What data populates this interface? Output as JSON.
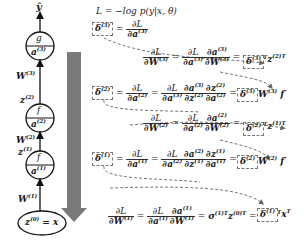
{
  "loss": {
    "label": "L = −log p(y|x, θ)"
  },
  "network": {
    "output": "ŷ",
    "nodes": [
      {
        "top": "g",
        "bottom": "a",
        "bottom_sup": "(3)"
      },
      {
        "top": "f",
        "bottom": "a",
        "bottom_sup": "(2)"
      },
      {
        "top": "f",
        "bottom": "a",
        "bottom_sup": "(1)"
      }
    ],
    "input": {
      "base": "z",
      "sup": "(0)",
      "rest": " = x"
    },
    "edge_labels": [
      {
        "base": "W",
        "sup": "(3)"
      },
      {
        "base": "z",
        "sup": "(2)"
      },
      {
        "base": "W",
        "sup": "(2)"
      },
      {
        "base": "z",
        "sup": "(1)"
      },
      {
        "base": "W",
        "sup": "(1)"
      }
    ]
  },
  "backprop_arrow": {
    "color": "#7a7a7a",
    "direction": "down"
  },
  "equations": {
    "delta3": {
      "delta": "δ",
      "sup": "(3)",
      "rhs_num": "∂L",
      "rhs_den": "∂a",
      "rhs_den_sup": "(3)"
    },
    "dW3": {
      "lhs_num": "∂L",
      "lhs_den": "∂W",
      "lhs_den_sup": "(3)",
      "mid1_num": "∂L",
      "mid1_den": "∂a",
      "mid1_den_sup": "(3)",
      "mid2_num": "∂a",
      "mid2_num_sup": "(3)",
      "mid2_den": "∂W",
      "mid2_den_sup": "(3)",
      "result_delta": "δ",
      "result_sup": "(3)",
      "result_tail": "ᵀz",
      "result_tail_sup": "(2)T"
    },
    "delta2": {
      "delta": "δ",
      "sup": "(2)",
      "rhs_num": "∂L",
      "rhs_den": "∂a",
      "rhs_den_sup": "(2)",
      "c1_num": "∂L",
      "c1_den": "∂a",
      "c1_den_sup": "(3)",
      "c2_num": "∂a",
      "c2_num_sup": "(3)",
      "c2_den": "∂z",
      "c2_den_sup": "(2)",
      "c3_num": "∂z",
      "c3_num_sup": "(2)",
      "c3_den": "∂a",
      "c3_den_sup": "(2)",
      "result_delta": "δ",
      "result_sup": "(3)",
      "result_tail": "W",
      "result_tail_sup": "(3)",
      "result_end": "f′"
    },
    "dW2": {
      "lhs_num": "∂L",
      "lhs_den": "∂W",
      "lhs_den_sup": "(2)",
      "mid1_num": "∂L",
      "mid1_den": "∂a",
      "mid1_den_sup": "(2)",
      "mid2_num": "∂a",
      "mid2_num_sup": "(2)",
      "mid2_den": "∂W",
      "mid2_den_sup": "(2)",
      "result_delta": "δ",
      "result_sup": "(2)",
      "result_tail": "ᵀz",
      "result_tail_sup": "(1)T"
    },
    "delta1": {
      "delta": "δ",
      "sup": "(1)",
      "rhs_num": "∂L",
      "rhs_den": "∂a",
      "rhs_den_sup": "(1)",
      "c1_num": "∂L",
      "c1_den": "∂a",
      "c1_den_sup": "(2)",
      "c2_num": "∂a",
      "c2_num_sup": "(2)",
      "c2_den": "∂z",
      "c2_den_sup": "(1)",
      "c3_num": "∂z",
      "c3_num_sup": "(1)",
      "c3_den": "∂a",
      "c3_den_sup": "(1)",
      "result_delta": "δ",
      "result_sup": "(2)",
      "result_tail": "W",
      "result_tail_sup": "(2)",
      "result_end": "f′"
    },
    "dW1": {
      "lhs_num": "∂L",
      "lhs_den": "∂W",
      "lhs_den_sup": "(1)",
      "mid1_num": "∂L",
      "mid1_den": "∂a",
      "mid1_den_sup": "(1)",
      "mid2_num": "∂a",
      "mid2_num_sup": "(1)",
      "mid2_den": "∂W",
      "mid2_den_sup": "(1)",
      "sigma": "σ",
      "sigma_sup": "(1)T",
      "sigma_z": "z",
      "sigma_z_sup": "(0)T",
      "result_delta": "δ",
      "result_sup": "(1)",
      "result_tail": "ᵀx",
      "result_tail_sup": "T"
    }
  }
}
